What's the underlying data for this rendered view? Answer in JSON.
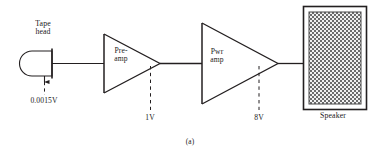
{
  "figure": {
    "caption": "(a)",
    "stroke_color": "#231f20",
    "background_color": "#ffffff"
  },
  "blocks": [
    {
      "id": "tape-head",
      "shape": "tape-head",
      "label_line1": "Tape",
      "label_line2": "head"
    },
    {
      "id": "pre-amp",
      "shape": "triangle-amplifier",
      "label_line1": "Pre-",
      "label_line2": "amp"
    },
    {
      "id": "pwr-amp",
      "shape": "triangle-amplifier",
      "label_line1": "Pwr",
      "label_line2": "amp"
    },
    {
      "id": "speaker",
      "shape": "rectangle-grille",
      "label": "Speaker"
    }
  ],
  "signal_levels": [
    {
      "id": "tape-head-output",
      "value": "0.0015V"
    },
    {
      "id": "preamp-output",
      "value": "1V"
    },
    {
      "id": "pwramp-output",
      "value": "8V"
    }
  ],
  "labels": {
    "tape_head_line1": "Tape",
    "tape_head_line2": "head",
    "tape_head_voltage": "0.0015V",
    "preamp_line1": "Pre-",
    "preamp_line2": "amp",
    "pwramp_line1": "Pwr",
    "pwramp_line2": "amp",
    "node1_voltage": "1V",
    "node2_voltage": "8V",
    "speaker": "Speaker",
    "caption": "(a)"
  }
}
